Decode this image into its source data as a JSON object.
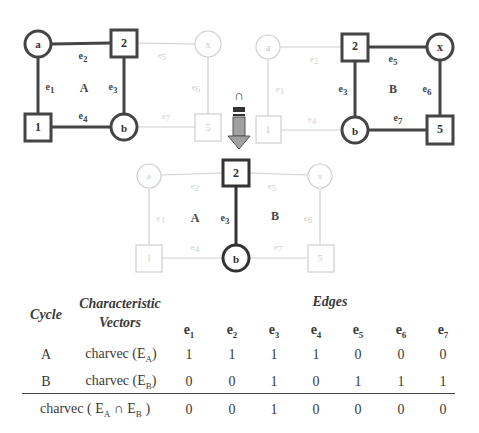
{
  "diagram": {
    "graph_left": {
      "cycle_label": "A",
      "nodes": [
        {
          "id": "a",
          "shape": "circle",
          "label": "a",
          "active": true
        },
        {
          "id": "2",
          "shape": "square",
          "label": "2",
          "active": true
        },
        {
          "id": "x",
          "shape": "circle",
          "label": "x",
          "active": false
        },
        {
          "id": "1",
          "shape": "square",
          "label": "1",
          "active": true
        },
        {
          "id": "b",
          "shape": "circle",
          "label": "b",
          "active": true
        },
        {
          "id": "5",
          "shape": "square",
          "label": "5",
          "active": false
        }
      ],
      "edge_labels": {
        "e1": "e",
        "e2": "e",
        "e3": "e",
        "e4": "e",
        "e5": "e",
        "e6": "e",
        "e7": "e"
      },
      "edge_subs": {
        "e1": "1",
        "e2": "2",
        "e3": "3",
        "e4": "4",
        "e5": "5",
        "e6": "6",
        "e7": "7"
      },
      "active_edges": [
        "e1",
        "e2",
        "e3",
        "e4"
      ]
    },
    "graph_right": {
      "cycle_label": "B",
      "active_edges": [
        "e3",
        "e5",
        "e6",
        "e7"
      ]
    },
    "graph_bottom": {
      "cycle_label_a": "A",
      "cycle_label_b": "B",
      "active_edges": [
        "e3"
      ]
    },
    "operator_symbol": "∩",
    "colors": {
      "active": "#444444",
      "inactive": "#c8c8c8",
      "arrow_fill": "#9a9a9a"
    }
  },
  "table": {
    "headers": {
      "cycle": "Cycle",
      "char_line1": "Characteristic",
      "char_line2": "Vectors",
      "edges": "Edges"
    },
    "edge_columns": [
      {
        "base": "e",
        "sub": "1"
      },
      {
        "base": "e",
        "sub": "2"
      },
      {
        "base": "e",
        "sub": "3"
      },
      {
        "base": "e",
        "sub": "4"
      },
      {
        "base": "e",
        "sub": "5"
      },
      {
        "base": "e",
        "sub": "6"
      },
      {
        "base": "e",
        "sub": "7"
      }
    ],
    "rows": [
      {
        "cycle": "A",
        "vector_prefix": "charvec (E",
        "vector_sub": "A",
        "vector_suffix": ")",
        "values": [
          "1",
          "1",
          "1",
          "1",
          "0",
          "0",
          "0"
        ]
      },
      {
        "cycle": "B",
        "vector_prefix": "charvec (E",
        "vector_sub": "B",
        "vector_suffix": ")",
        "values": [
          "0",
          "0",
          "1",
          "0",
          "1",
          "1",
          "1"
        ]
      }
    ],
    "result_row": {
      "prefix": "charvec ( E",
      "sub_a": "A",
      "op": " ∩ E",
      "sub_b": "B",
      "suffix": " )",
      "values": [
        "0",
        "0",
        "1",
        "0",
        "0",
        "0",
        "0"
      ]
    }
  }
}
